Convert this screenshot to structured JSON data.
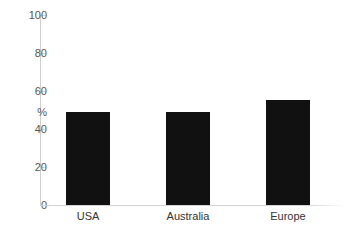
{
  "chart_data": {
    "type": "bar",
    "title": "",
    "subtitle": "",
    "xlabel": "",
    "ylabel": "%",
    "categories": [
      "USA",
      "Australia",
      "Europe"
    ],
    "values": [
      49,
      49,
      55
    ],
    "ylim": [
      0,
      100
    ],
    "yticks": [
      0,
      20,
      40,
      60,
      80,
      100
    ],
    "ytick_labels": [
      "0",
      "20",
      "40",
      "60",
      "80",
      "100"
    ],
    "grid": false,
    "legend": null,
    "legend_position": "none",
    "bar_color": "#111111",
    "axis_color": "#cfcfcf",
    "text_color": "#555555"
  },
  "axis": {
    "unit_label": "%",
    "tick_100": "100",
    "tick_80": "80",
    "tick_60": "60",
    "tick_40": "40",
    "tick_20": "20",
    "tick_0": "0"
  },
  "bars": {
    "usa_label": "USA",
    "australia_label": "Australia",
    "europe_label": "Europe"
  }
}
